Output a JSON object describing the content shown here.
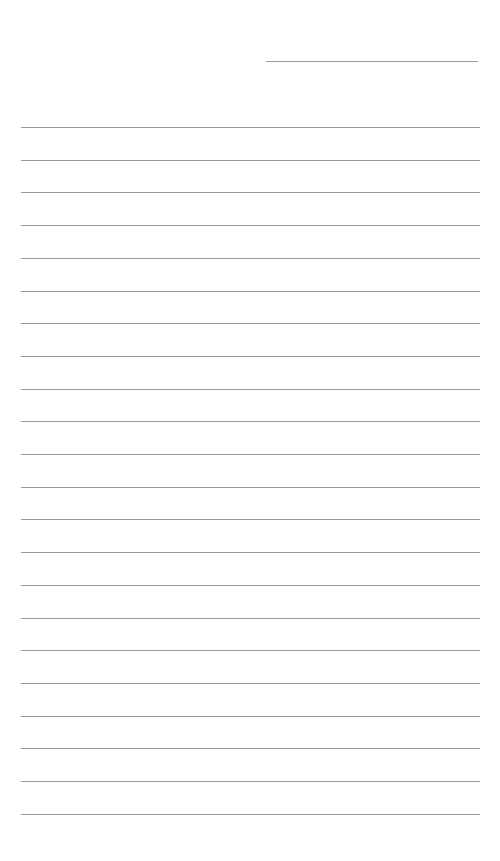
{
  "page": {
    "type": "lined-paper",
    "background": "#ffffff",
    "line_color": "#9a9a9a",
    "header_line": {
      "present": true
    },
    "ruled_lines": {
      "count": 22,
      "first_y": 127,
      "spacing": 32.7
    }
  }
}
